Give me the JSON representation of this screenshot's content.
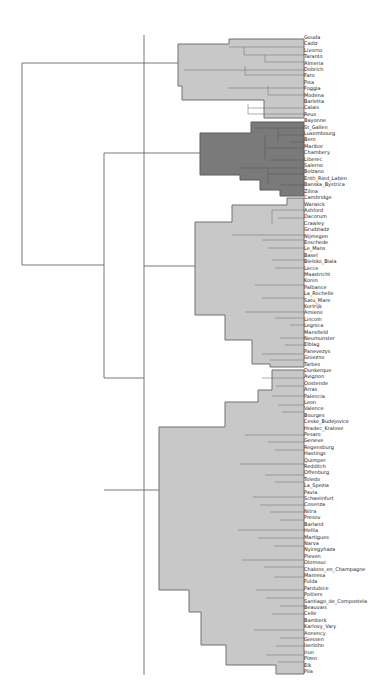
{
  "chart_data": {
    "type": "dendrogram",
    "orientation": "horizontal, leaves on right",
    "title": "",
    "colors": {
      "cluster_light": "#c8c8c8",
      "cluster_dark": "#7a7a7a",
      "cluster_border": "#6e6e6e",
      "link": "#555555"
    },
    "clusters": [
      {
        "name": "cluster-1",
        "shade": "light",
        "leaves": [
          "Gouda",
          "Cadiz",
          "Livorno",
          "Taranto",
          "Almeria",
          "Dobrich",
          "Faro",
          "Pisa",
          "Foggia",
          "Modena",
          "Barletta",
          "Calais",
          "Reus"
        ]
      },
      {
        "name": "cluster-2",
        "shade": "dark",
        "leaves": [
          "Bayonne",
          "St_Gallen",
          "Luxembourg",
          "Bern",
          "Maribor",
          "Chambery",
          "Liberec",
          "Salerno",
          "Bolzano",
          "Enth_Ried_Laben",
          "Banska_Bystrica",
          "Zilina"
        ]
      },
      {
        "name": "cluster-3",
        "shade": "light",
        "leaves": [
          "Cambridge",
          "Warwick",
          "Ashford",
          "Dacorum",
          "Crawley",
          "Grudziadz",
          "Nijmegen",
          "Enschede",
          "Le_Mans",
          "Basel",
          "Bielsko_Biala",
          "Lecce",
          "Maastricht",
          "Konin",
          "Palbance",
          "La_Rochelle",
          "Satu_Mare",
          "Kortrijk",
          "Amiens",
          "Lincoln",
          "Legnica",
          "Mansfield",
          "Neumunster",
          "Elblag",
          "Panevezys",
          "Gniezno",
          "Tarbes",
          "Dunkerque",
          "Avignon",
          "Oostende"
        ]
      },
      {
        "name": "cluster-4",
        "shade": "light",
        "leaves": [
          "Arras",
          "Palencia",
          "Leon",
          "Valence",
          "Bourges",
          "Ceske_Budejovice",
          "Hradec_Kralove",
          "Pesaro",
          "Geneve",
          "Regensburg",
          "Hastings",
          "Quimper",
          "Redditch",
          "Offenburg",
          "Toledo",
          "La_Spezia",
          "Pavia",
          "Schweinfurt",
          "Cosenza",
          "Nitra",
          "Presov",
          "Barland",
          "Hellia",
          "Martigues",
          "Narva",
          "Nyiregyhaza",
          "Pleven",
          "Olomouc",
          "Chalons_en_Champagne",
          "Manresa",
          "Fulda",
          "Pardubice",
          "Poitiers",
          "Santiago_de_Compostela",
          "Beauvais",
          "Celle",
          "Bamberk",
          "Karlovy_Vary",
          "Annency",
          "Giessen",
          "Iserlohn",
          "Irun",
          "Plzen",
          "Elk",
          "Pila"
        ]
      }
    ],
    "axis": {
      "xlabel": "",
      "ylabel": "",
      "ticks": []
    },
    "legend": null
  }
}
